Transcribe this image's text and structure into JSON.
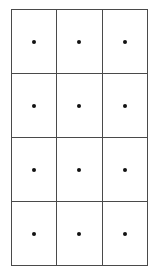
{
  "figure": {
    "name": "dot-grid-figure",
    "background_color": "#ffffff",
    "line_color": "#4a4a4a",
    "dot_color": "#111111",
    "columns": 3,
    "rows": 4,
    "total_cells": 12,
    "dots_per_cell": 1
  },
  "grid": {
    "cells": [
      {
        "id": "cell-r1-c1",
        "row": 1,
        "column": 1,
        "dot_count": 1
      },
      {
        "id": "cell-r1-c2",
        "row": 1,
        "column": 2,
        "dot_count": 1
      },
      {
        "id": "cell-r1-c3",
        "row": 1,
        "column": 3,
        "dot_count": 1
      },
      {
        "id": "cell-r2-c1",
        "row": 2,
        "column": 1,
        "dot_count": 1
      },
      {
        "id": "cell-r2-c2",
        "row": 2,
        "column": 2,
        "dot_count": 1
      },
      {
        "id": "cell-r2-c3",
        "row": 2,
        "column": 3,
        "dot_count": 1
      },
      {
        "id": "cell-r3-c1",
        "row": 3,
        "column": 1,
        "dot_count": 1
      },
      {
        "id": "cell-r3-c2",
        "row": 3,
        "column": 2,
        "dot_count": 1
      },
      {
        "id": "cell-r3-c3",
        "row": 3,
        "column": 3,
        "dot_count": 1
      },
      {
        "id": "cell-r4-c1",
        "row": 4,
        "column": 1,
        "dot_count": 1
      },
      {
        "id": "cell-r4-c2",
        "row": 4,
        "column": 2,
        "dot_count": 1
      },
      {
        "id": "cell-r4-c3",
        "row": 4,
        "column": 3,
        "dot_count": 1
      }
    ]
  }
}
